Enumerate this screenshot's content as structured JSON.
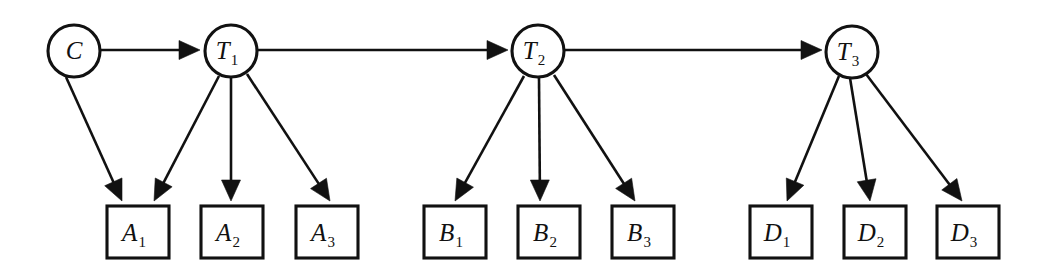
{
  "diagram": {
    "type": "directed-graph",
    "background_color": "#ffffff",
    "stroke_color": "#111111",
    "circle_nodes": [
      {
        "id": "C",
        "base": "C",
        "sub": "",
        "cx": 74,
        "cy": 51,
        "r": 26
      },
      {
        "id": "T1",
        "base": "T",
        "sub": "1",
        "cx": 231,
        "cy": 51,
        "r": 26
      },
      {
        "id": "T2",
        "base": "T",
        "sub": "2",
        "cx": 538,
        "cy": 51,
        "r": 26
      },
      {
        "id": "T3",
        "base": "T",
        "sub": "3",
        "cx": 852,
        "cy": 52,
        "r": 26
      }
    ],
    "box_nodes": [
      {
        "id": "A1",
        "base": "A",
        "sub": "1",
        "x": 107,
        "y": 206,
        "w": 62,
        "h": 52
      },
      {
        "id": "A2",
        "base": "A",
        "sub": "2",
        "x": 201,
        "y": 206,
        "w": 62,
        "h": 52
      },
      {
        "id": "A3",
        "base": "A",
        "sub": "3",
        "x": 296,
        "y": 206,
        "w": 62,
        "h": 52
      },
      {
        "id": "B1",
        "base": "B",
        "sub": "1",
        "x": 424,
        "y": 206,
        "w": 62,
        "h": 52
      },
      {
        "id": "B2",
        "base": "B",
        "sub": "2",
        "x": 518,
        "y": 206,
        "w": 62,
        "h": 52
      },
      {
        "id": "B3",
        "base": "B",
        "sub": "3",
        "x": 612,
        "y": 206,
        "w": 62,
        "h": 52
      },
      {
        "id": "D1",
        "base": "D",
        "sub": "1",
        "x": 750,
        "y": 206,
        "w": 62,
        "h": 52
      },
      {
        "id": "D2",
        "base": "D",
        "sub": "2",
        "x": 844,
        "y": 206,
        "w": 62,
        "h": 52
      },
      {
        "id": "D3",
        "base": "D",
        "sub": "3",
        "x": 937,
        "y": 206,
        "w": 62,
        "h": 52
      }
    ],
    "edges": [
      {
        "from": "C",
        "to": "T1",
        "x1": 101,
        "y1": 50,
        "x2": 200,
        "y2": 50
      },
      {
        "from": "T1",
        "to": "T2",
        "x1": 258,
        "y1": 50,
        "x2": 508,
        "y2": 50
      },
      {
        "from": "T2",
        "to": "T3",
        "x1": 565,
        "y1": 50,
        "x2": 822,
        "y2": 50
      },
      {
        "from": "C",
        "to": "A1",
        "x1": 66,
        "y1": 77,
        "x2": 122,
        "y2": 201
      },
      {
        "from": "T1",
        "to": "A1",
        "x1": 219,
        "y1": 76,
        "x2": 154,
        "y2": 201
      },
      {
        "from": "T1",
        "to": "A2",
        "x1": 231,
        "y1": 78,
        "x2": 231,
        "y2": 201
      },
      {
        "from": "T1",
        "to": "A3",
        "x1": 247,
        "y1": 74,
        "x2": 330,
        "y2": 201
      },
      {
        "from": "T2",
        "to": "B1",
        "x1": 524,
        "y1": 76,
        "x2": 455,
        "y2": 201
      },
      {
        "from": "T2",
        "to": "B2",
        "x1": 539,
        "y1": 78,
        "x2": 540,
        "y2": 201
      },
      {
        "from": "T2",
        "to": "B3",
        "x1": 554,
        "y1": 75,
        "x2": 635,
        "y2": 201
      },
      {
        "from": "T3",
        "to": "D1",
        "x1": 839,
        "y1": 76,
        "x2": 787,
        "y2": 201
      },
      {
        "from": "T3",
        "to": "D2",
        "x1": 850,
        "y1": 78,
        "x2": 870,
        "y2": 201
      },
      {
        "from": "T3",
        "to": "D3",
        "x1": 866,
        "y1": 74,
        "x2": 962,
        "y2": 201
      }
    ],
    "legend": {
      "circle_meaning": "latent state node",
      "box_meaning": "observed evidence node"
    }
  }
}
